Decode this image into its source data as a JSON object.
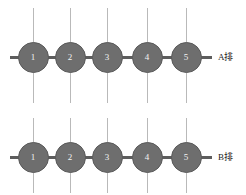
{
  "diagram": {
    "type": "node-chain-diagram",
    "background_color": "#ffffff",
    "node_fill_color": "#6e6e6e",
    "node_label_color": "#f2f2f2",
    "bar_color": "#5d5d5d",
    "vline_color": "#b9b9b9",
    "label_color": "#1b1b1b",
    "node_diameter": 31,
    "rows": [
      {
        "id": "row-a",
        "label": "A排",
        "center_y": 57,
        "label_x": 218,
        "label_y": 52,
        "bar": {
          "x": 10,
          "width": 202
        },
        "vline": {
          "top": 8,
          "bottom": 103
        },
        "nodes": [
          {
            "label": "1",
            "cx": 33
          },
          {
            "label": "2",
            "cx": 70
          },
          {
            "label": "3",
            "cx": 107
          },
          {
            "label": "4",
            "cx": 147
          },
          {
            "label": "5",
            "cx": 186
          }
        ]
      },
      {
        "id": "row-b",
        "label": "B排",
        "center_y": 157,
        "label_x": 218,
        "label_y": 152,
        "bar": {
          "x": 10,
          "width": 202
        },
        "vline": {
          "top": 118,
          "bottom": 193
        },
        "nodes": [
          {
            "label": "1",
            "cx": 33
          },
          {
            "label": "2",
            "cx": 70
          },
          {
            "label": "3",
            "cx": 107
          },
          {
            "label": "4",
            "cx": 147
          },
          {
            "label": "5",
            "cx": 186
          }
        ]
      }
    ]
  }
}
